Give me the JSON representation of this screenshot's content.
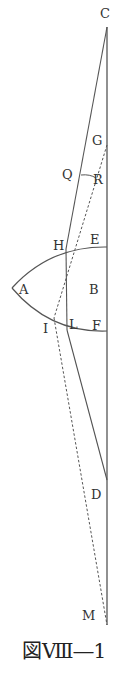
{
  "figure": {
    "caption": "図Ⅷ―1",
    "colors": {
      "line": "#555555",
      "text": "#333333"
    },
    "points": {
      "C": {
        "label": "C",
        "x": 107,
        "y": 27
      },
      "G": {
        "label": "G",
        "x": 107,
        "y": 145
      },
      "Q": {
        "label": "Q",
        "x": 84,
        "y": 175
      },
      "R": {
        "label": "R",
        "x": 97,
        "y": 178
      },
      "H": {
        "label": "H",
        "x": 66,
        "y": 249
      },
      "E": {
        "label": "E",
        "x": 107,
        "y": 247
      },
      "A": {
        "label": "A",
        "x": 12,
        "y": 288
      },
      "B": {
        "label": "B",
        "x": 95,
        "y": 288
      },
      "I": {
        "label": "I",
        "x": 54,
        "y": 318
      },
      "L": {
        "label": "L",
        "x": 67,
        "y": 330
      },
      "F": {
        "label": "F",
        "x": 107,
        "y": 331
      },
      "D": {
        "label": "D",
        "x": 107,
        "y": 480
      },
      "M": {
        "label": "M",
        "x": 107,
        "y": 625
      }
    }
  }
}
